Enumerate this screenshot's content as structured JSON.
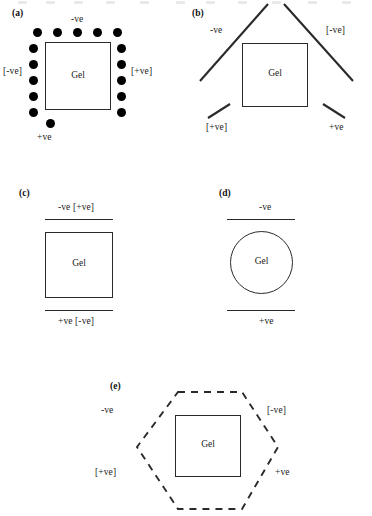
{
  "figure": {
    "background_color": "#ffffff",
    "ink_color": "#2a2a2a",
    "gel_label": "Gel"
  },
  "panels": [
    {
      "id": "a",
      "label": "(a)",
      "shape": "square",
      "electrode_style": "point-array-dots",
      "gel_label": "Gel",
      "electrodes": {
        "top": "-ve",
        "bottom": "+ve",
        "left": "[-ve]",
        "right": "[+ve]"
      },
      "dot_counts": {
        "top": 5,
        "left": 5,
        "right": 5,
        "bottom": 1
      }
    },
    {
      "id": "b",
      "label": "(b)",
      "shape": "square",
      "electrode_style": "angled-solid-lines",
      "gel_label": "Gel",
      "electrodes": {
        "top_left": "-ve",
        "top_right": "[-ve]",
        "bottom_left": "[+ve]",
        "bottom_right": "+ve"
      }
    },
    {
      "id": "c",
      "label": "(c)",
      "shape": "square",
      "electrode_style": "parallel-horizontal-lines",
      "gel_label": "Gel",
      "electrodes": {
        "top": "-ve [+ve]",
        "bottom": "+ve [-ve]"
      }
    },
    {
      "id": "d",
      "label": "(d)",
      "shape": "circle",
      "electrode_style": "parallel-horizontal-lines",
      "gel_label": "Gel",
      "electrodes": {
        "top": "-ve",
        "bottom": "+ve"
      }
    },
    {
      "id": "e",
      "label": "(e)",
      "shape": "square",
      "electrode_style": "dashed-hexagon",
      "gel_label": "Gel",
      "electrodes": {
        "top_left": "-ve",
        "top_right": "[-ve]",
        "bottom_left": "[+ve]",
        "bottom_right": "+ve"
      }
    }
  ]
}
